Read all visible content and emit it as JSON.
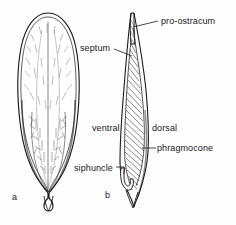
{
  "figure": {
    "background_color": "#fdfdfd",
    "ink_color": "#1b1b1b",
    "width": 236,
    "height": 225,
    "panels": [
      {
        "letter": "a",
        "caption": "a",
        "description": "whole belemnite guard, external view"
      },
      {
        "letter": "b",
        "caption": "b",
        "description": "longitudinal section showing phragmocone and septa"
      }
    ],
    "labels": [
      {
        "id": "pro-ostracum",
        "text": "pro-ostracum"
      },
      {
        "id": "septum",
        "text": "septum"
      },
      {
        "id": "ventral",
        "text": "ventral"
      },
      {
        "id": "dorsal",
        "text": "dorsal"
      },
      {
        "id": "phragmocone",
        "text": "phragmocone"
      },
      {
        "id": "siphuncle",
        "text": "siphuncle"
      }
    ]
  }
}
